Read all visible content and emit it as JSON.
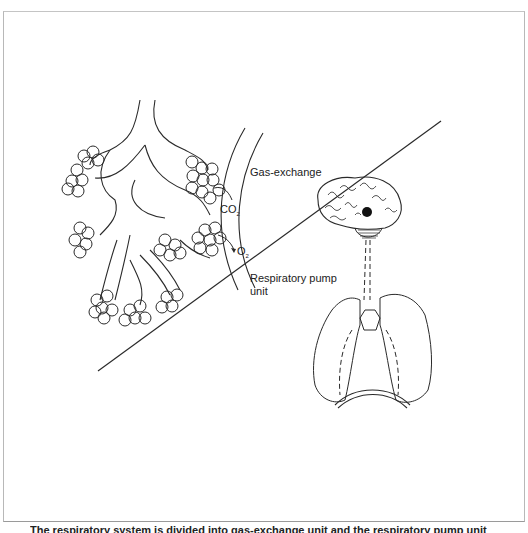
{
  "figure": {
    "labels": {
      "gas_exchange": "Gas-exchange",
      "co2": "CO",
      "co2_sub": "2",
      "o2": "O",
      "o2_sub": "2",
      "respiratory_pump_line1": "Respiratory pump",
      "respiratory_pump_line2": "unit"
    },
    "caption_partial": "The respiratory system is divided into gas-exchange unit and the respiratory pump unit",
    "colors": {
      "line": "#2a2a2a",
      "background": "#ffffff",
      "frame": "#b8b8b8"
    }
  }
}
